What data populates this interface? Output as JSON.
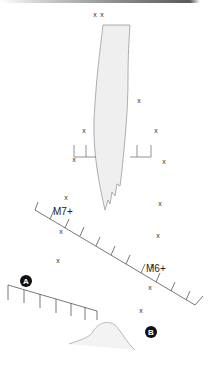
{
  "diagram": {
    "labels": {
      "m7": "M7+",
      "m6": "M6+",
      "a": "A",
      "b": "B"
    },
    "marker_symbol": "x",
    "markers": [
      {
        "x": 95,
        "y": 17
      },
      {
        "x": 102,
        "y": 17
      },
      {
        "x": 139,
        "y": 103
      },
      {
        "x": 84,
        "y": 133
      },
      {
        "x": 156,
        "y": 133
      },
      {
        "x": 74,
        "y": 162
      },
      {
        "x": 164,
        "y": 164
      },
      {
        "x": 66,
        "y": 200
      },
      {
        "x": 160,
        "y": 206
      },
      {
        "x": 61,
        "y": 234
      },
      {
        "x": 158,
        "y": 238
      },
      {
        "x": 58,
        "y": 263
      },
      {
        "x": 152,
        "y": 268
      },
      {
        "x": 150,
        "y": 290
      },
      {
        "x": 141,
        "y": 313
      }
    ],
    "colors": {
      "outline": "#9a9a9a",
      "fill": "#efefef",
      "badge": "#111111"
    }
  }
}
